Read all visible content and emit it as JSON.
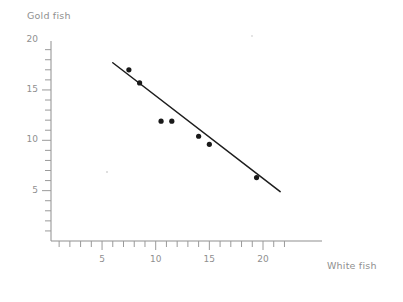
{
  "chart_data": {
    "type": "scatter",
    "title": "",
    "subtitle": "",
    "xlabel": "White fish",
    "ylabel": "Gold fish",
    "xlim": [
      0,
      23.2
    ],
    "ylim": [
      0,
      20.8
    ],
    "grid": false,
    "legend": "none",
    "x_ticks_major": [
      5,
      10,
      15,
      20
    ],
    "y_ticks_major": [
      5,
      10,
      15,
      20
    ],
    "x_tick_step_minor": 1,
    "y_tick_step_minor": 1,
    "x_tick_labels": [
      "5",
      "10",
      "15",
      "20"
    ],
    "y_tick_labels": [
      "5",
      "10",
      "15",
      "20"
    ],
    "points": [
      {
        "x": 7.5,
        "y": 17.0
      },
      {
        "x": 8.5,
        "y": 15.7
      },
      {
        "x": 10.5,
        "y": 11.9
      },
      {
        "x": 11.5,
        "y": 11.9
      },
      {
        "x": 14.0,
        "y": 10.4
      },
      {
        "x": 15.0,
        "y": 9.6
      },
      {
        "x": 19.4,
        "y": 6.3
      }
    ],
    "trend_line": {
      "label": "line of best fit",
      "x_start": 6.0,
      "y_start": 17.7,
      "x_end": 21.6,
      "y_end": 4.9
    },
    "colors": {
      "point": "#1a1a1a",
      "trend_line": "#1d1d1d",
      "axis": "#8f8f8f",
      "tick": "#9a9a9a",
      "text": "#8f8f8f",
      "background": "#ffffff"
    }
  }
}
